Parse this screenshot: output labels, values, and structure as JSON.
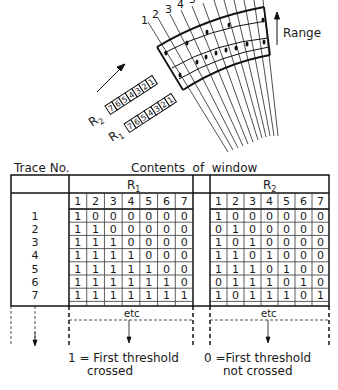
{
  "diagram": {
    "trace_labels": [
      "1",
      "2",
      "3",
      "4",
      "5"
    ],
    "range_label": "Range",
    "register_r2_label": "R",
    "register_r2_sub": "2",
    "register_r1_label": "R",
    "register_r1_sub": "1",
    "register_cells": [
      "7",
      "6",
      "5",
      "4",
      "3",
      "2",
      "1"
    ]
  },
  "table": {
    "trace_header": "Trace No.",
    "contents_header": "Contents  of  window",
    "r1_label": "R",
    "r1_sub": "1",
    "r2_label": "R",
    "r2_sub": "2",
    "column_numbers": [
      "1",
      "2",
      "3",
      "4",
      "5",
      "6",
      "7"
    ],
    "trace_numbers": [
      "1",
      "2",
      "3",
      "4",
      "5",
      "6",
      "7"
    ],
    "r1_rows": [
      [
        "1",
        "0",
        "0",
        "0",
        "0",
        "0",
        "0"
      ],
      [
        "1",
        "1",
        "0",
        "0",
        "0",
        "0",
        "0"
      ],
      [
        "1",
        "1",
        "1",
        "0",
        "0",
        "0",
        "0"
      ],
      [
        "1",
        "1",
        "1",
        "1",
        "0",
        "0",
        "0"
      ],
      [
        "1",
        "1",
        "1",
        "1",
        "1",
        "0",
        "0"
      ],
      [
        "1",
        "1",
        "1",
        "1",
        "1",
        "1",
        "0"
      ],
      [
        "1",
        "1",
        "1",
        "1",
        "1",
        "1",
        "1"
      ]
    ],
    "r2_rows": [
      [
        "1",
        "0",
        "0",
        "0",
        "0",
        "0",
        "0"
      ],
      [
        "0",
        "1",
        "0",
        "0",
        "0",
        "0",
        "0"
      ],
      [
        "1",
        "0",
        "1",
        "0",
        "0",
        "0",
        "0"
      ],
      [
        "1",
        "1",
        "0",
        "1",
        "0",
        "0",
        "0"
      ],
      [
        "1",
        "1",
        "1",
        "0",
        "1",
        "0",
        "0"
      ],
      [
        "0",
        "1",
        "1",
        "1",
        "0",
        "1",
        "0"
      ],
      [
        "1",
        "0",
        "1",
        "1",
        "1",
        "0",
        "1"
      ]
    ],
    "etc_label": "etc"
  },
  "legend": {
    "one_line1": "1 = First threshold",
    "one_line2": "crossed",
    "zero_line1": "0 =First threshold",
    "zero_line2": "not crossed"
  }
}
